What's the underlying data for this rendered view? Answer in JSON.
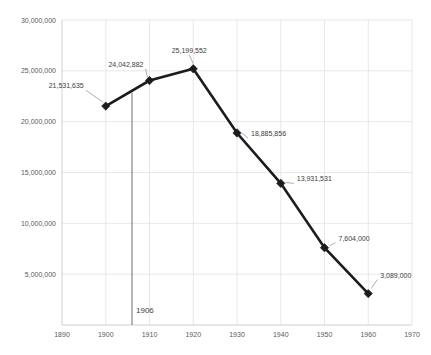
{
  "chart_data": {
    "type": "line",
    "title": "",
    "subtitle": "",
    "xlabel": "",
    "ylabel": "",
    "xlim": [
      1890,
      1970
    ],
    "ylim": [
      0,
      30000000
    ],
    "grid": true,
    "legend": "none",
    "x": [
      1900,
      1910,
      1920,
      1930,
      1940,
      1950,
      1960
    ],
    "values": [
      21531635,
      24042882,
      25199552,
      18885856,
      13931531,
      7604000,
      3089000
    ],
    "point_labels": [
      "21,531,635",
      "24,042,882",
      "25,199,552",
      "18,885,856",
      "13,931,531",
      "7,604,000",
      "3,089,000"
    ],
    "series": [
      {
        "name": "series-1",
        "values": [
          21531635,
          24042882,
          25199552,
          18885856,
          13931531,
          7604000,
          3089000
        ]
      }
    ],
    "x_tick_labels": [
      "1890",
      "1900",
      "1910",
      "1920",
      "1930",
      "1940",
      "1950",
      "1960",
      "1970"
    ],
    "x_ticks": [
      1890,
      1900,
      1910,
      1920,
      1930,
      1940,
      1950,
      1960,
      1970
    ],
    "y_tick_labels": [
      "5,000,000",
      "10,000,000",
      "15,000,000",
      "20,000,000",
      "25,000,000",
      "30,000,000"
    ],
    "y_ticks": [
      5000000,
      10000000,
      15000000,
      20000000,
      25000000,
      30000000
    ],
    "annotations": [
      {
        "name": "vertical-marker-1906",
        "label": "1906",
        "x": 1906,
        "y_from": 22850000,
        "y_to": 0
      }
    ],
    "colors": {
      "series_line": "#1c1c1c",
      "marker": "#1c1c1c",
      "gridline": "#e2e2e2",
      "axis": "#c9c9c9",
      "tick_text": "#5a5a5a",
      "label_text": "#3d3d3d",
      "annotation_line": "#5f5f5f",
      "background": "#ffffff"
    }
  }
}
